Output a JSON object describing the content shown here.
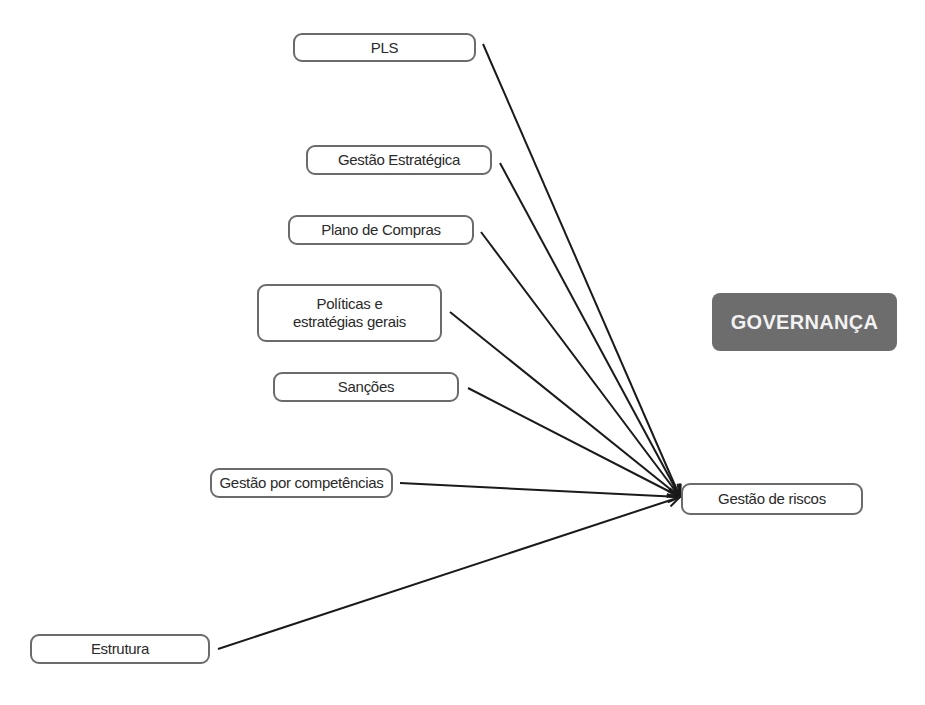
{
  "diagram": {
    "title_badge": "GOVERNANÇA",
    "source_node": "Gestão de riscos",
    "target_nodes": [
      {
        "label": "PLS"
      },
      {
        "label": "Gestão Estratégica"
      },
      {
        "label": "Plano de Compras"
      },
      {
        "label": "Políticas e estratégias gerais"
      },
      {
        "label": "Sanções"
      },
      {
        "label": "Gestão por competências"
      },
      {
        "label": "Estrutura"
      }
    ],
    "colors": {
      "badge_bg": "#6d6d6d",
      "badge_text": "#f2f2f2",
      "node_border": "#6b6b6b",
      "arrow": "#1a1a1a"
    }
  }
}
